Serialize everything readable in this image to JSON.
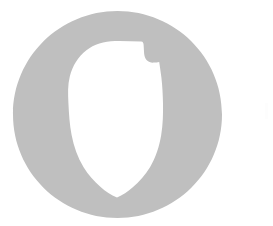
{
  "canvas": {
    "width": 273,
    "height": 226,
    "background_color": "#ffffff",
    "description": "Scanned type specimen showing a single large letter glyph"
  },
  "glyph": {
    "character": "O",
    "name": "letter-o-glyph",
    "fill_color": "#bfbfbf",
    "counter_color": "#ffffff",
    "outer": {
      "left": 13,
      "top": 11,
      "right": 222,
      "bottom": 218,
      "width": 209,
      "height": 207,
      "center_x": 117.5,
      "center_y": 114.5,
      "radius_x": 104.5,
      "radius_y": 103.5,
      "shape": "ellipse"
    },
    "counter": {
      "shape": "asymmetric-leaf",
      "top": 41,
      "bottom": 182,
      "left": 68,
      "right": 163,
      "widest_y": 110,
      "bottom_point_x": 117,
      "bottom_point_y": 182,
      "has_bottom_point": true,
      "notch": {
        "name": "upper-right-notch",
        "x_start": 148,
        "x_end": 158,
        "y_start": 48,
        "y_end": 62,
        "description": "concave bracket indentation on upper-right of inner counter"
      }
    },
    "stroke_weight": {
      "left": 55,
      "right": 59,
      "top": 30,
      "bottom": 36
    }
  },
  "artifacts": [
    {
      "name": "right-edge-speck",
      "x": 265,
      "y": 103,
      "width": 3,
      "height": 16,
      "color": "#fdfdfd",
      "description": "near-white scan artifact at far right margin"
    }
  ],
  "accessibility": {
    "alt_text": "Large grey capital letter O with an asymmetric leaf-shaped counter that tapers to a point at the bottom and has a notch on the upper right"
  }
}
